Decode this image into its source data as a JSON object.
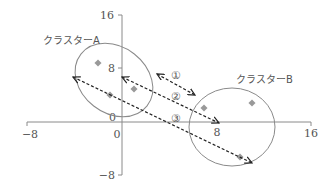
{
  "diagram": {
    "type": "cluster-distance-diagram",
    "axes": {
      "x_ticks": [
        {
          "label": "−8",
          "value": -8
        },
        {
          "label": "0",
          "value": 0
        },
        {
          "label": "8",
          "value": 8
        },
        {
          "label": "16",
          "value": 16
        }
      ],
      "y_ticks": [
        {
          "label": "16",
          "value": 16
        },
        {
          "label": "8",
          "value": 8
        },
        {
          "label": "0",
          "value": 0
        },
        {
          "label": "−8",
          "value": -8
        }
      ],
      "x_range": [
        -8,
        16
      ],
      "y_range": [
        -8,
        16
      ]
    },
    "clusters": [
      {
        "name": "クラスターA",
        "points": [
          [
            -2,
            9
          ],
          [
            -1,
            4
          ],
          [
            1.5,
            5
          ]
        ]
      },
      {
        "name": "クラスターB",
        "points": [
          [
            7,
            2
          ],
          [
            11,
            3
          ],
          [
            10,
            -5
          ]
        ]
      }
    ],
    "arrows": [
      {
        "label": "①",
        "kind": "bidirectional",
        "meaning": "nearest points distance"
      },
      {
        "label": "②",
        "kind": "bidirectional",
        "meaning": "centroid distance"
      },
      {
        "label": "③",
        "kind": "bidirectional",
        "meaning": "farthest points distance"
      }
    ],
    "colors": {
      "axis": "#8a8a8a",
      "ellipse": "#8a8a8a",
      "point": "#999999",
      "arrow": "#222222",
      "text": "#555555"
    }
  }
}
